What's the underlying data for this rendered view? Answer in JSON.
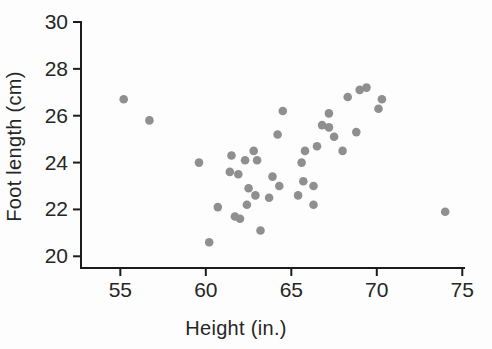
{
  "figure": {
    "background": "#fdfdfd"
  },
  "chart_data": {
    "type": "scatter",
    "title": "",
    "xlabel": "Height (in.)",
    "ylabel": "Foot length (cm)",
    "x_ticks": [
      55,
      60,
      65,
      70,
      75
    ],
    "y_ticks": [
      20,
      22,
      24,
      26,
      28,
      30
    ],
    "xlim": [
      52.7,
      75.1
    ],
    "ylim": [
      19.5,
      30.0
    ],
    "grid": false,
    "legend": "none",
    "point_color": "#8f8f8f",
    "axis_color": "#1c1c1c",
    "tick_label_color": "#262626",
    "points": [
      [
        55.2,
        26.7
      ],
      [
        56.7,
        25.8
      ],
      [
        59.6,
        24.0
      ],
      [
        60.2,
        20.6
      ],
      [
        60.7,
        22.1
      ],
      [
        61.4,
        23.6
      ],
      [
        61.5,
        24.3
      ],
      [
        61.7,
        21.7
      ],
      [
        61.9,
        23.5
      ],
      [
        62.0,
        21.6
      ],
      [
        62.3,
        24.1
      ],
      [
        62.4,
        22.2
      ],
      [
        62.5,
        22.9
      ],
      [
        62.8,
        24.5
      ],
      [
        62.9,
        22.6
      ],
      [
        63.0,
        24.1
      ],
      [
        63.2,
        21.1
      ],
      [
        63.7,
        22.5
      ],
      [
        63.9,
        23.4
      ],
      [
        64.2,
        25.2
      ],
      [
        64.3,
        23.0
      ],
      [
        64.5,
        26.2
      ],
      [
        65.4,
        22.6
      ],
      [
        65.6,
        24.0
      ],
      [
        65.7,
        23.2
      ],
      [
        65.8,
        24.5
      ],
      [
        66.3,
        23.0
      ],
      [
        66.3,
        22.2
      ],
      [
        66.5,
        24.7
      ],
      [
        66.8,
        25.6
      ],
      [
        67.2,
        26.1
      ],
      [
        67.2,
        25.5
      ],
      [
        67.5,
        25.1
      ],
      [
        68.0,
        24.5
      ],
      [
        68.3,
        26.8
      ],
      [
        68.8,
        25.3
      ],
      [
        69.0,
        27.1
      ],
      [
        69.4,
        27.2
      ],
      [
        70.1,
        26.3
      ],
      [
        70.3,
        26.7
      ],
      [
        74.0,
        21.9
      ]
    ]
  }
}
